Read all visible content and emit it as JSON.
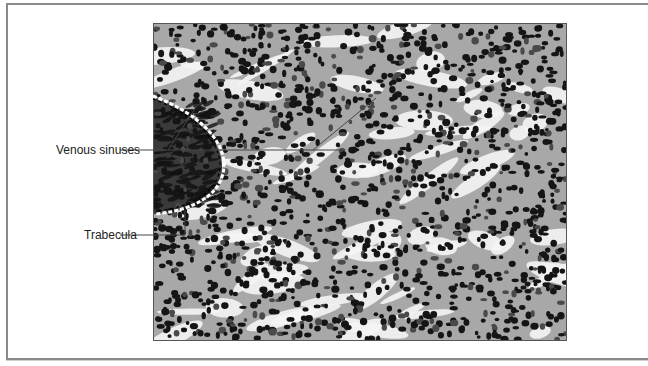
{
  "figure": {
    "type": "histology-micrograph",
    "labels": [
      {
        "id": "venous-sinuses",
        "text": "Venous sinuses"
      },
      {
        "id": "trabecula",
        "text": "Trabecula"
      }
    ]
  }
}
